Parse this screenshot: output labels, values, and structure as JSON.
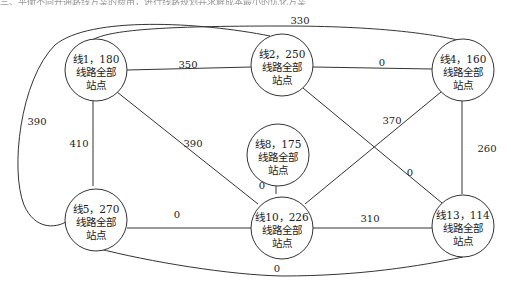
{
  "header": {
    "text": "三、平衡不同开通路线方案的费用，进行线路规划并求解成本最小的优化方案"
  },
  "diagram": {
    "node_line2": "线路全部",
    "node_line3": "站点",
    "nodes": [
      {
        "id": "n1",
        "label": "线1，180",
        "x": 96,
        "y": 70
      },
      {
        "id": "n2",
        "label": "线2，250",
        "x": 282,
        "y": 65
      },
      {
        "id": "n4",
        "label": "线4，160",
        "x": 463,
        "y": 70
      },
      {
        "id": "n8",
        "label": "线8，175",
        "x": 282,
        "y": 155
      },
      {
        "id": "n5",
        "label": "线5，270",
        "x": 96,
        "y": 217
      },
      {
        "id": "n10",
        "label": "线10，226",
        "x": 282,
        "y": 225
      },
      {
        "id": "n13",
        "label": "线13，114",
        "x": 463,
        "y": 225
      }
    ],
    "edges": [
      {
        "from": "n1",
        "to": "n2",
        "weight": "350"
      },
      {
        "from": "n2",
        "to": "n4",
        "weight": "0"
      },
      {
        "from": "n1",
        "to": "n4",
        "weight": "330"
      },
      {
        "from": "n1",
        "to": "n5",
        "weight": "410"
      },
      {
        "from": "n1",
        "to": "n10",
        "weight": "390"
      },
      {
        "from": "n2",
        "to": "n5",
        "weight": "390"
      },
      {
        "from": "n2",
        "to": "n13",
        "weight": "0"
      },
      {
        "from": "n4",
        "to": "n10",
        "weight": "370"
      },
      {
        "from": "n4",
        "to": "n13",
        "weight": "260"
      },
      {
        "from": "n8",
        "to": "n10",
        "weight": "0"
      },
      {
        "from": "n5",
        "to": "n10",
        "weight": "0"
      },
      {
        "from": "n10",
        "to": "n13",
        "weight": "310"
      },
      {
        "from": "n5",
        "to": "n13",
        "weight": "0"
      }
    ]
  }
}
